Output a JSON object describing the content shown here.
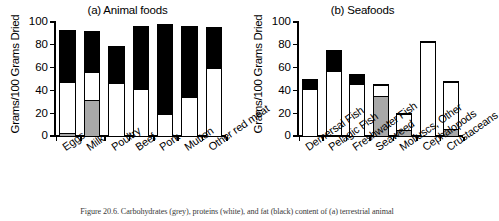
{
  "caption": "Figure 20.6. Carbohydrates (grey), proteins (white), and fat (black) content of (a) terrestrial animal",
  "axis": {
    "ylabel": "Grams/100 Grams Dried",
    "yticks": [
      "0",
      "20",
      "40",
      "60",
      "80",
      "100"
    ]
  },
  "legend": {
    "carbohydrate_label": "Carbohydrates (grey)",
    "protein_label": "proteins (white)",
    "fat_label": "fat (black)",
    "carbohydrate_color": "#a8a8a8",
    "protein_color": "#ffffff",
    "fat_color": "#000000"
  },
  "chart_data": [
    {
      "type": "bar",
      "title": "(a) Animal foods",
      "xlabel": "",
      "ylabel": "Grams/100 Grams Dried",
      "ylim": [
        0,
        100
      ],
      "yticks": [
        0,
        20,
        40,
        60,
        80,
        100
      ],
      "grid": false,
      "stacked": true,
      "legend_position": "none",
      "categories": [
        "Eggs",
        "Milk",
        "Poultry",
        "Beef",
        "Pork",
        "Mutton",
        "Other red meat"
      ],
      "series": [
        {
          "name": "Carbohydrates",
          "color": "#a8a8a8",
          "values": [
            3,
            32,
            0,
            0,
            0,
            0,
            0
          ]
        },
        {
          "name": "Proteins",
          "color": "#ffffff",
          "values": [
            46,
            26,
            47,
            42,
            20,
            35,
            60
          ]
        },
        {
          "name": "Fat",
          "color": "#000000",
          "values": [
            47,
            37,
            33,
            56,
            80,
            63,
            37
          ]
        }
      ],
      "totals": [
        96,
        95,
        80,
        98,
        100,
        98,
        97
      ]
    },
    {
      "type": "bar",
      "title": "(b) Seafoods",
      "xlabel": "",
      "ylabel": "Grams/100 Grams Dried",
      "ylim": [
        0,
        100
      ],
      "yticks": [
        0,
        20,
        40,
        60,
        80,
        100
      ],
      "grid": false,
      "stacked": true,
      "legend_position": "none",
      "categories": [
        "Demersal Fish",
        "Pelagic Fish",
        "Freshwater Fish",
        "Seaweed",
        "Molluscs, Other",
        "Cephalopods",
        "Crustaceans"
      ],
      "series": [
        {
          "name": "Carbohydrates",
          "color": "#a8a8a8",
          "values": [
            0,
            1,
            0,
            36,
            6,
            0,
            7
          ]
        },
        {
          "name": "Proteins",
          "color": "#ffffff",
          "values": [
            42,
            57,
            46,
            10,
            15,
            83,
            42
          ]
        },
        {
          "name": "Fat",
          "color": "#000000",
          "values": [
            10,
            19,
            10,
            2,
            1,
            2,
            1
          ]
        }
      ],
      "totals": [
        52,
        77,
        56,
        48,
        22,
        85,
        50
      ]
    }
  ]
}
